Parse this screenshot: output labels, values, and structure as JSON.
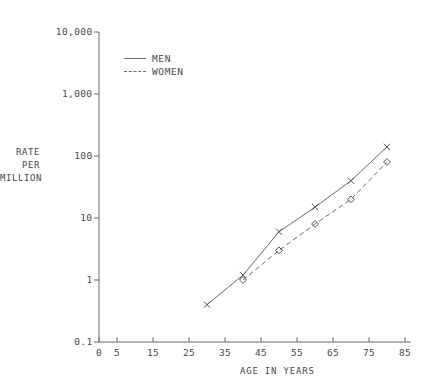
{
  "colors": {
    "background": "#ffffff",
    "axis": "#6b6b6b",
    "text": "#4a4a4a",
    "line": "#6b6b6b",
    "marker": "#555555"
  },
  "chart_data": {
    "type": "line",
    "title": "",
    "xlabel": "AGE IN YEARS",
    "ylabel": "RATE PER MILLION",
    "ylabel_lines": [
      "RATE",
      "PER",
      "MILLION"
    ],
    "x_scale": "linear",
    "y_scale": "log",
    "xlim": [
      0,
      87
    ],
    "ylim": [
      0.1,
      10000
    ],
    "grid": false,
    "legend_position": "top-left-inside",
    "x_ticks": [
      {
        "v": 0,
        "label": "0"
      },
      {
        "v": 5,
        "label": "5"
      },
      {
        "v": 15,
        "label": "15"
      },
      {
        "v": 25,
        "label": "25"
      },
      {
        "v": 35,
        "label": "35"
      },
      {
        "v": 45,
        "label": "45"
      },
      {
        "v": 55,
        "label": "55"
      },
      {
        "v": 65,
        "label": "65"
      },
      {
        "v": 75,
        "label": "75"
      },
      {
        "v": 85,
        "label": "85"
      }
    ],
    "y_ticks": [
      {
        "v": 0.1,
        "label": "0.1"
      },
      {
        "v": 1,
        "label": "1"
      },
      {
        "v": 10,
        "label": "10"
      },
      {
        "v": 100,
        "label": "100"
      },
      {
        "v": 1000,
        "label": "1,000"
      },
      {
        "v": 10000,
        "label": "10,000"
      }
    ],
    "series": [
      {
        "name": "MEN",
        "line_style": "solid",
        "marker": "x",
        "points": [
          [
            30,
            0.4
          ],
          [
            40,
            1.2
          ],
          [
            50,
            6
          ],
          [
            60,
            15
          ],
          [
            70,
            40
          ],
          [
            80,
            140
          ]
        ]
      },
      {
        "name": "WOMEN",
        "line_style": "dashed",
        "marker": "open-diamond",
        "points": [
          [
            40,
            1.0
          ],
          [
            50,
            3.0
          ],
          [
            60,
            8
          ],
          [
            70,
            20
          ],
          [
            80,
            80
          ]
        ]
      }
    ]
  }
}
